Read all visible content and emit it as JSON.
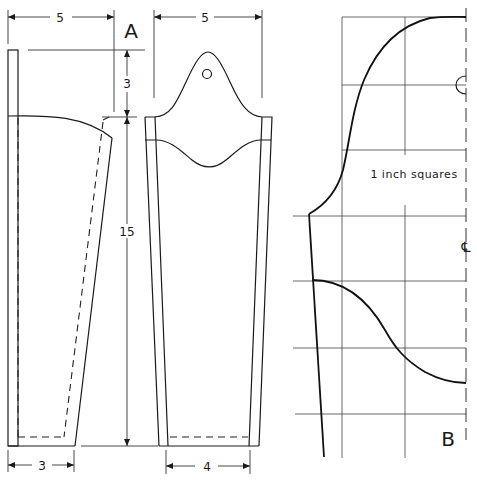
{
  "figure": {
    "part_a_label": "A",
    "part_b_label": "B",
    "grid_note": "1 inch squares",
    "centerline_symbol": "℄",
    "hanging_hole": "circle"
  },
  "dimensions": {
    "side_top_width": "5",
    "back_top_width": "5",
    "back_bracket_height": "3",
    "overall_height": "15",
    "side_bottom_width": "3",
    "back_bottom_width": "4"
  },
  "colors": {
    "line": "#1a1a1a",
    "background": "#ffffff"
  }
}
